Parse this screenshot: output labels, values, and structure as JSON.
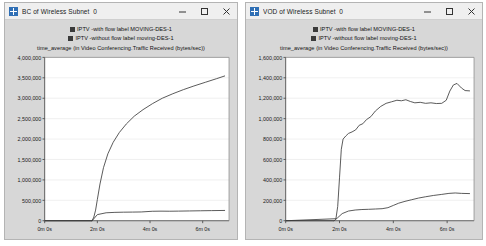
{
  "windows": [
    {
      "id": "bc",
      "title": "BC of Wireless Subnet_0",
      "icon": "opnet-window-icon",
      "controls": {
        "minimize": "minimize-icon",
        "maximize": "maximize-icon",
        "close": "close-icon"
      },
      "legend": [
        {
          "label": "IPTV -with flow label MOVING-DES-1",
          "color": "#3a3a3a"
        },
        {
          "label": "IPTV -without flow label moving-DES-1",
          "color": "#3a3a3a"
        }
      ],
      "subtitle": "time_average (in Video Conferencing.Traffic Received (bytes/sec))",
      "chart_data": {
        "type": "line",
        "title": "time_average (in Video Conferencing.Traffic Received (bytes/sec))",
        "xlabel": "",
        "ylabel": "",
        "grid": true,
        "legend_position": "top-center",
        "xlim": [
          0,
          420
        ],
        "ylim": [
          0,
          4000000
        ],
        "xtick_labels": [
          "0m 0s",
          "2m 0s",
          "4m 0s",
          "6m 0s"
        ],
        "xtick_values": [
          0,
          120,
          240,
          360
        ],
        "ytick_labels": [
          "0",
          "500,000",
          "1,000,000",
          "1,500,000",
          "2,000,000",
          "2,500,000",
          "3,000,000",
          "3,500,000",
          "4,000,000"
        ],
        "ytick_values": [
          0,
          500000,
          1000000,
          1500000,
          2000000,
          2500000,
          3000000,
          3500000,
          4000000
        ],
        "series": [
          {
            "name": "IPTV -with flow label MOVING-DES-1",
            "color": "#3a3a3a",
            "x": [
              108,
              112,
              116,
              120,
              126,
              134,
              144,
              156,
              170,
              186,
              204,
              224,
              246,
              268,
              292,
              316,
              340,
              366,
              392,
              410
            ],
            "y": [
              0,
              90000,
              260000,
              520000,
              900000,
              1300000,
              1640000,
              1920000,
              2160000,
              2370000,
              2560000,
              2720000,
              2870000,
              3000000,
              3110000,
              3210000,
              3300000,
              3390000,
              3480000,
              3545000
            ]
          },
          {
            "name": "IPTV -without flow label moving-DES-1",
            "color": "#3a3a3a",
            "x": [
              108,
              120,
              140,
              160,
              180,
              200,
              220,
              245,
              265,
              285,
              305,
              330,
              355,
              380,
              410
            ],
            "y": [
              0,
              150000,
              195000,
              205000,
              210000,
              212000,
              215000,
              232000,
              235000,
              233000,
              236000,
              240000,
              244000,
              248000,
              252000
            ]
          }
        ]
      }
    },
    {
      "id": "vod",
      "title": "VOD of Wireless Subnet_0",
      "icon": "opnet-window-icon",
      "controls": {
        "minimize": "minimize-icon",
        "maximize": "maximize-icon",
        "close": "close-icon"
      },
      "legend": [
        {
          "label": "IPTV -with flow label MOVING-DES-1",
          "color": "#3a3a3a"
        },
        {
          "label": "IPTV -without flow label moving-DES-1",
          "color": "#3a3a3a"
        }
      ],
      "subtitle": "time_average (in Video Conferencing.Traffic Received (bytes/sec))",
      "chart_data": {
        "type": "line",
        "title": "time_average (in Video Conferencing.Traffic Received (bytes/sec))",
        "xlabel": "",
        "ylabel": "",
        "grid": true,
        "legend_position": "top-center",
        "xlim": [
          0,
          420
        ],
        "ylim": [
          0,
          1600000
        ],
        "xtick_labels": [
          "0m 0s",
          "2m 0s",
          "4m 0s",
          "6m 0s"
        ],
        "xtick_values": [
          0,
          120,
          240,
          360
        ],
        "ytick_labels": [
          "0",
          "200,000",
          "400,000",
          "600,000",
          "800,000",
          "1,000,000",
          "1,200,000",
          "1,400,000",
          "1,600,000"
        ],
        "ytick_values": [
          0,
          200000,
          400000,
          600000,
          800000,
          1000000,
          1200000,
          1400000,
          1600000
        ],
        "series": [
          {
            "name": "IPTV -with flow label MOVING-DES-1",
            "color": "#3a3a3a",
            "x": [
              112,
              116,
              120,
              124,
              128,
              134,
              140,
              148,
              156,
              164,
              172,
              180,
              190,
              200,
              212,
              224,
              236,
              248,
              258,
              268,
              278,
              288,
              300,
              312,
              324,
              336,
              348,
              358,
              366,
              374,
              382,
              392,
              400,
              410
            ],
            "y": [
              20000,
              140000,
              420000,
              700000,
              800000,
              830000,
              855000,
              870000,
              890000,
              935000,
              950000,
              990000,
              1020000,
              1075000,
              1120000,
              1150000,
              1165000,
              1180000,
              1175000,
              1185000,
              1168000,
              1155000,
              1160000,
              1150000,
              1155000,
              1148000,
              1150000,
              1180000,
              1270000,
              1330000,
              1345000,
              1300000,
              1275000,
              1272000
            ]
          },
          {
            "name": "IPTV -without flow label moving-DES-1",
            "color": "#3a3a3a",
            "x": [
              108,
              116,
              126,
              140,
              155,
              170,
              185,
              200,
              215,
              228,
              240,
              252,
              266,
              280,
              296,
              312,
              330,
              348,
              364,
              378,
              392,
              410
            ],
            "y": [
              0,
              30000,
              70000,
              95000,
              105000,
              110000,
              112000,
              115000,
              118000,
              128000,
              150000,
              172000,
              190000,
              205000,
              222000,
              235000,
              248000,
              258000,
              268000,
              272000,
              268000,
              266000
            ]
          }
        ]
      }
    }
  ]
}
